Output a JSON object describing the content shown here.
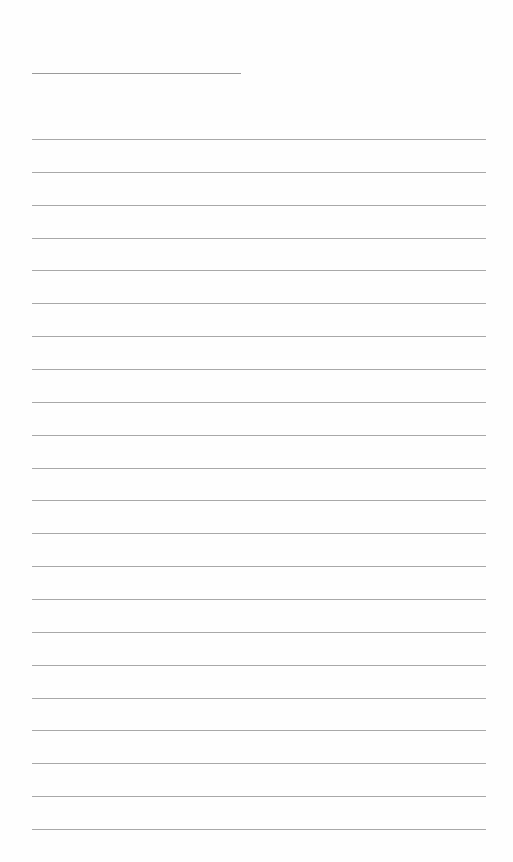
{
  "page": {
    "type": "lined-notebook-page",
    "title_line": {
      "top": 73,
      "left": 32,
      "width": 209
    },
    "rules": {
      "count": 22,
      "first_top": 139,
      "spacing": 32.86,
      "left": 32,
      "width": 454,
      "color": "#a8a8a8"
    },
    "text_content": []
  }
}
